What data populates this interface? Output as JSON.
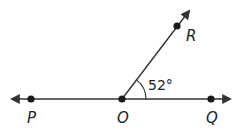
{
  "diagram": {
    "type": "geometry-angle",
    "colors": {
      "stroke": "#333333",
      "point": "#1a1a1a",
      "text": "#222222"
    },
    "line": {
      "name": "line PQ",
      "through": [
        "P",
        "O",
        "Q"
      ],
      "arrows": "both"
    },
    "ray": {
      "name": "ray OR",
      "from": "O",
      "through": "R",
      "arrow": "end"
    },
    "points": [
      {
        "id": "P",
        "label": "P"
      },
      {
        "id": "O",
        "label": "O"
      },
      {
        "id": "Q",
        "label": "Q"
      },
      {
        "id": "R",
        "label": "R"
      }
    ],
    "angle": {
      "vertex": "O",
      "between": [
        "Q",
        "R"
      ],
      "label": "52°",
      "measure_degrees": 52
    }
  }
}
